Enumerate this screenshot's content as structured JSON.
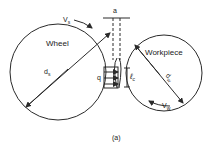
{
  "figure": {
    "caption": "(a)",
    "wheel": {
      "label": "Wheel",
      "velocity_label": "V",
      "velocity_sub": "s",
      "diameter_label": "d",
      "diameter_sub": "s"
    },
    "workpiece": {
      "label": "Workpiece",
      "velocity_label": "V",
      "velocity_sub": "w",
      "diameter_label": "d",
      "diameter_sub": "w"
    },
    "depth_of_cut_label": "a",
    "heat_flux_label": "q",
    "contact_length_label": "ℓ",
    "contact_length_sub": "c"
  },
  "colors": {
    "line": "#2a2a2a",
    "background": "#ffffff"
  }
}
